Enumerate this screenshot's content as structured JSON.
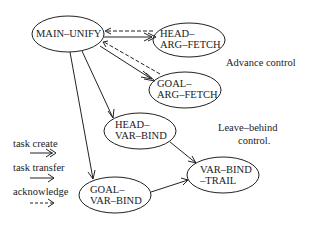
{
  "nodes": {
    "main_unify": {
      "line1": "MAIN–UNIFY"
    },
    "head_arg_fetch": {
      "line1": "HEAD–",
      "line2": "ARG–FETCH"
    },
    "goal_arg_fetch": {
      "line1": "GOAL–",
      "line2": "ARG–FETCH"
    },
    "head_var_bind": {
      "line1": "HEAD–",
      "line2": "VAR–BIND"
    },
    "goal_var_bind": {
      "line1": "GOAL–",
      "line2": "VAR–BIND"
    },
    "var_bind_trail": {
      "line1": "VAR–BIND",
      "line2": "–TRAIL"
    }
  },
  "annotations": {
    "advance_control": "Advance control",
    "leave_behind_line1": "Leave–behind",
    "leave_behind_line2": "control."
  },
  "legend": {
    "task_create": "task create",
    "task_transfer": "task transfer",
    "acknowledge": "acknowledge"
  },
  "edges": [
    {
      "from": "MAIN-UNIFY",
      "to": "HEAD-ARG-FETCH",
      "type": "task create"
    },
    {
      "from": "HEAD-ARG-FETCH",
      "to": "MAIN-UNIFY",
      "type": "acknowledge"
    },
    {
      "from": "MAIN-UNIFY",
      "to": "GOAL-ARG-FETCH",
      "type": "task create"
    },
    {
      "from": "GOAL-ARG-FETCH",
      "to": "MAIN-UNIFY",
      "type": "acknowledge"
    },
    {
      "from": "MAIN-UNIFY",
      "to": "HEAD-VAR-BIND",
      "type": "task transfer"
    },
    {
      "from": "MAIN-UNIFY",
      "to": "GOAL-VAR-BIND",
      "type": "task transfer"
    },
    {
      "from": "HEAD-VAR-BIND",
      "to": "VAR-BIND-TRAIL",
      "type": "task transfer"
    },
    {
      "from": "GOAL-VAR-BIND",
      "to": "VAR-BIND-TRAIL",
      "type": "task transfer"
    }
  ]
}
